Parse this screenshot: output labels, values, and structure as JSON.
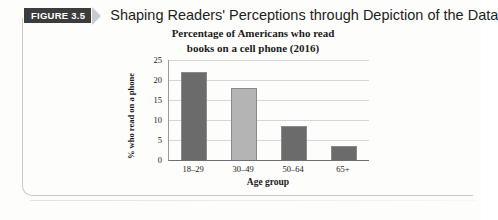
{
  "figure": {
    "badge_label": "FIGURE 3.5",
    "caption": "Shaping Readers' Perceptions through Depiction of the Data",
    "chevron_icon": "chevron-right-icon",
    "badge_bg": "#3c3c3c",
    "badge_fg": "#ffffff",
    "chevron_color": "#c9ccce",
    "frame_border_color": "#c6c9cb"
  },
  "chart_data": {
    "type": "bar",
    "title": "Percentage of Americans who read books on a cell phone (2016)",
    "title_line1": "Percentage of Americans who read",
    "title_line2": "books on a cell phone (2016)",
    "xlabel": "Age group",
    "ylabel": "% who read on a phone",
    "categories": [
      "18–29",
      "30–49",
      "50–64",
      "65+"
    ],
    "values": [
      22,
      18,
      8.5,
      3.5
    ],
    "ylim": [
      0,
      25
    ],
    "yticks": [
      25,
      20,
      15,
      10,
      5,
      0
    ],
    "grid": true,
    "legend": "none",
    "bar_colors": [
      "#6b6b6b",
      "#b4b4b4",
      "#6b6b6b",
      "#6b6b6b"
    ],
    "bar_border_color": "#8a8a8a",
    "axis_color": "#6f6f6f",
    "gridline_color": "#d4d6d7"
  }
}
